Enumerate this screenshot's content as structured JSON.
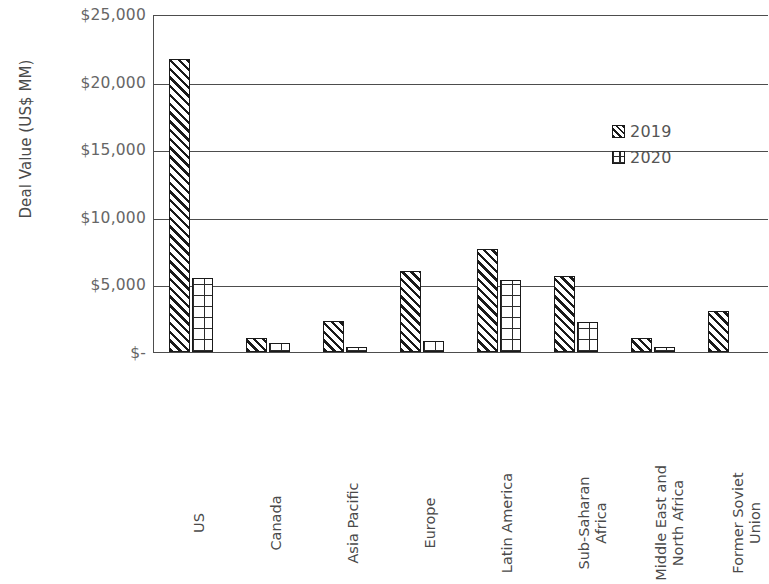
{
  "chart_data": {
    "type": "bar",
    "title": "",
    "subtitle": "",
    "xlabel": "",
    "ylabel": "Deal Value (US$ MM)",
    "ylim": [
      0,
      25000
    ],
    "ytick_values": [
      0,
      5000,
      10000,
      15000,
      20000,
      25000
    ],
    "ytick_labels": [
      "$-",
      "$5,000",
      "$10,000",
      "$15,000",
      "$20,000",
      "$25,000"
    ],
    "grid": true,
    "legend_position": "inside-top-right",
    "categories": [
      "US",
      "Canada",
      "Asia Pacific",
      "Europe",
      "Latin America",
      "Sub-Saharan Africa",
      "Middle East and North Africa",
      "Former Soviet Union"
    ],
    "category_display": [
      "US",
      "Canada",
      "Asia Pacific",
      "Europe",
      "Latin America",
      "Sub-Saharan\nAfrica",
      "Middle East and\nNorth Africa",
      "Former Soviet\nUnion"
    ],
    "series": [
      {
        "name": "2019",
        "pattern": "diagonal-hatch",
        "values": [
          21700,
          1000,
          2300,
          6000,
          7600,
          5600,
          1000,
          3000
        ]
      },
      {
        "name": "2020",
        "pattern": "grid-crosshatch",
        "values": [
          5500,
          700,
          400,
          800,
          5300,
          2200,
          400,
          0
        ]
      }
    ]
  },
  "legend": {
    "items": [
      {
        "label": "2019",
        "swatch": "diagonal-hatch-swatch"
      },
      {
        "label": "2020",
        "swatch": "grid-crosshatch-swatch"
      }
    ]
  },
  "colors": {
    "axis": "#4d4d4d",
    "bar_outline": "#1a1a1a",
    "text": "#595959",
    "background": "#ffffff"
  }
}
